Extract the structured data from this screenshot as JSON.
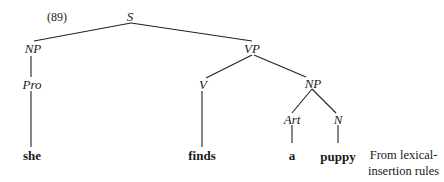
{
  "figure": {
    "number": "(89)",
    "note_line1": "From lexical-",
    "note_line2": "insertion rules"
  },
  "tree": {
    "nodes": {
      "S": "S",
      "NP_subj": "NP",
      "Pro": "Pro",
      "VP": "VP",
      "V": "V",
      "NP_obj": "NP",
      "Art": "Art",
      "N": "N"
    },
    "words": {
      "she": "she",
      "finds": "finds",
      "a": "a",
      "puppy": "puppy"
    },
    "edges": [
      [
        "S",
        "NP_subj"
      ],
      [
        "S",
        "VP"
      ],
      [
        "NP_subj",
        "Pro"
      ],
      [
        "Pro",
        "she"
      ],
      [
        "VP",
        "V"
      ],
      [
        "VP",
        "NP_obj"
      ],
      [
        "V",
        "finds"
      ],
      [
        "NP_obj",
        "Art"
      ],
      [
        "NP_obj",
        "N"
      ],
      [
        "Art",
        "a"
      ],
      [
        "N",
        "puppy"
      ]
    ]
  }
}
